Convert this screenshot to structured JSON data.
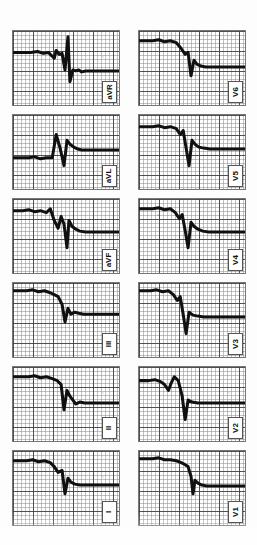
{
  "document": {
    "kind": "12-lead electrocardiogram recording",
    "paper_color": "#fdfdfd",
    "trace_color": "#101010",
    "grid_major_color": "#3c3c3c",
    "grid_minor_color": "#787878",
    "orientation_note": "lead label boxes printed rotated 90 degrees"
  },
  "chart_data": {
    "type": "line",
    "xlabel": "",
    "ylabel": "",
    "grid": true,
    "legend_position": "in-panel-label",
    "panel_layout": {
      "columns": 2,
      "rows": 6
    },
    "grid_spec": {
      "small_box_px": 4,
      "large_box_px": 20,
      "small_box_mm": 1,
      "large_box_mm": 5
    },
    "series": [
      {
        "name": "aVR",
        "column": "left",
        "row": 1,
        "values": [
          0,
          0,
          0,
          0,
          0,
          0,
          -1,
          0,
          0,
          0,
          2,
          -13,
          3,
          1,
          1,
          0,
          0,
          -2,
          -2,
          -1,
          0,
          0,
          0,
          0,
          0
        ]
      },
      {
        "name": "aVL",
        "column": "left",
        "row": 2,
        "values": [
          0,
          0,
          0,
          0,
          -1,
          0,
          0,
          8,
          -2,
          -9,
          6,
          5,
          4,
          3,
          2,
          1,
          0,
          0,
          0,
          0,
          0,
          0,
          0,
          0,
          0
        ]
      },
      {
        "name": "aVF",
        "column": "left",
        "row": 3,
        "values": [
          0,
          0,
          0,
          1,
          2,
          4,
          6,
          3,
          -4,
          -2,
          7,
          -10,
          4,
          5,
          2,
          1,
          0,
          0,
          0,
          0,
          0,
          0,
          0,
          0,
          0
        ]
      },
      {
        "name": "III",
        "column": "left",
        "row": 4,
        "values": [
          0,
          0,
          0,
          0,
          0,
          1,
          2,
          3,
          2,
          1,
          0,
          -4,
          -3,
          2,
          4,
          3,
          1,
          0,
          0,
          0,
          0,
          0,
          0,
          0,
          0
        ]
      },
      {
        "name": "II",
        "column": "left",
        "row": 5,
        "values": [
          0,
          0,
          0,
          0,
          0,
          0,
          0,
          1,
          2,
          1,
          0,
          -6,
          2,
          3,
          2,
          1,
          0,
          -1,
          0,
          0,
          0,
          0,
          0,
          0,
          0
        ]
      },
      {
        "name": "I",
        "column": "left",
        "row": 6,
        "values": [
          0,
          0,
          0,
          0,
          0,
          0,
          0,
          2,
          4,
          3,
          -1,
          -6,
          3,
          4,
          2,
          1,
          0,
          0,
          0,
          0,
          0,
          0,
          0,
          0,
          0
        ]
      },
      {
        "name": "V6",
        "column": "right",
        "row": 1,
        "values": [
          0,
          0,
          0,
          0,
          0,
          0,
          1,
          3,
          6,
          4,
          1,
          -7,
          3,
          4,
          3,
          2,
          1,
          0,
          0,
          0,
          0,
          0,
          0,
          0,
          0
        ]
      },
      {
        "name": "V5",
        "column": "right",
        "row": 2,
        "values": [
          0,
          0,
          0,
          0,
          0,
          1,
          3,
          7,
          -1,
          -6,
          5,
          4,
          3,
          2,
          1,
          0,
          0,
          -2,
          -1,
          0,
          0,
          0,
          0,
          0,
          0
        ]
      },
      {
        "name": "V4",
        "column": "right",
        "row": 3,
        "values": [
          0,
          0,
          0,
          0,
          0,
          1,
          3,
          6,
          -2,
          -7,
          4,
          5,
          3,
          2,
          1,
          0,
          0,
          -2,
          -1,
          0,
          0,
          0,
          0,
          0,
          0
        ]
      },
      {
        "name": "V3",
        "column": "right",
        "row": 4,
        "values": [
          0,
          0,
          0,
          0,
          1,
          2,
          5,
          9,
          -3,
          -8,
          5,
          4,
          3,
          2,
          1,
          0,
          0,
          -3,
          -2,
          0,
          0,
          0,
          0,
          0,
          0
        ]
      },
      {
        "name": "V2",
        "column": "right",
        "row": 5,
        "values": [
          0,
          0,
          0,
          1,
          3,
          7,
          14,
          6,
          -4,
          -10,
          6,
          5,
          3,
          2,
          1,
          0,
          0,
          -4,
          -3,
          -1,
          0,
          0,
          0,
          0,
          0
        ]
      },
      {
        "name": "V1",
        "column": "right",
        "row": 6,
        "values": [
          0,
          0,
          0,
          0,
          0,
          0,
          1,
          2,
          1,
          -3,
          -9,
          4,
          3,
          2,
          1,
          0,
          0,
          -2,
          -1,
          0,
          0,
          0,
          0,
          0,
          0
        ]
      }
    ]
  },
  "panels": [
    {
      "id": "panel-avr",
      "label": "aVR",
      "path": "M0,22 L18,22 L25,21 L31,23 L36,22 L42,28 L44,20 L47,24 L50,23 L53,40 L56,6 L58,52 L61,40 L64,41 L67,40 L70,42 L74,41 L80,41 L90,41 L108,41"
    },
    {
      "id": "panel-avl",
      "label": "aVL",
      "path": "M0,44 L16,44 L22,43 L28,45 L34,44 L40,44 L44,20 L48,34 L52,52 L55,26 L58,30 L62,33 L66,35 L70,36 L76,36 L86,36 L108,36"
    },
    {
      "id": "panel-avf",
      "label": "aVF",
      "path": "M0,12 L10,12 L16,11 L22,13 L28,12 L34,14 L38,10 L42,22 L46,30 L49,18 L52,26 L55,50 L57,22 L60,28 L64,31 L68,33 L74,34 L84,34 L108,34"
    },
    {
      "id": "panel-iii",
      "label": "III",
      "path": "M0,8 L14,8 L20,7 L26,9 L32,8 L38,10 L42,12 L46,14 L50,22 L53,40 L56,26 L59,32 L63,30 L67,31 L72,32 L80,32 L92,32 L108,32"
    },
    {
      "id": "panel-ii",
      "label": "II",
      "path": "M0,10 L16,10 L22,9 L28,11 L34,10 L40,12 L45,14 L49,18 L52,44 L55,24 L58,30 L61,34 L64,38 L68,36 L73,37 L82,37 L95,37 L108,37"
    },
    {
      "id": "panel-i",
      "label": "I",
      "path": "M0,10 L14,10 L20,9 L26,11 L32,10 L38,12 L42,16 L46,22 L50,20 L53,44 L56,28 L59,32 L63,34 L68,35 L74,35 L84,35 L96,35 L108,35"
    },
    {
      "id": "panel-v6",
      "label": "V6",
      "path": "M0,10 L14,10 L20,9 L26,11 L32,10 L38,12 L43,18 L47,24 L50,22 L53,46 L56,30 L59,34 L63,36 L68,37 L74,37 L84,37 L96,37 L108,37"
    },
    {
      "id": "panel-v5",
      "label": "V5",
      "path": "M0,12 L14,12 L20,11 L26,13 L32,12 L38,14 L42,20 L45,16 L48,34 L51,52 L54,26 L57,30 L61,33 L66,34 L72,35 L82,35 L95,35 L108,35"
    },
    {
      "id": "panel-v4",
      "label": "V4",
      "path": "M0,10 L14,10 L20,9 L26,11 L32,10 L37,14 L41,20 L44,16 L47,32 L50,50 L53,24 L56,28 L60,31 L65,33 L71,34 L81,34 L94,34 L108,34"
    },
    {
      "id": "panel-v3",
      "label": "V3",
      "path": "M0,8 L12,8 L18,7 L24,9 L30,8 L35,12 L39,18 L42,14 L45,32 L48,52 L51,30 L55,33 L60,34 L66,35 L74,35 L86,35 L98,35 L108,35"
    },
    {
      "id": "panel-v2",
      "label": "V2",
      "path": "M0,14 L10,14 L16,13 L22,15 L26,18 L30,24 L33,16 L36,10 L40,14 L44,30 L47,54 L50,34 L54,36 L60,37 L68,37 L80,37 L94,37 L108,37"
    },
    {
      "id": "panel-v1",
      "label": "V1",
      "path": "M0,8 L14,8 L20,7 L26,9 L32,9 L38,10 L43,12 L47,14 L50,16 L53,26 L55,44 L57,30 L60,33 L64,35 L69,36 L76,36 L88,36 L108,36"
    }
  ]
}
